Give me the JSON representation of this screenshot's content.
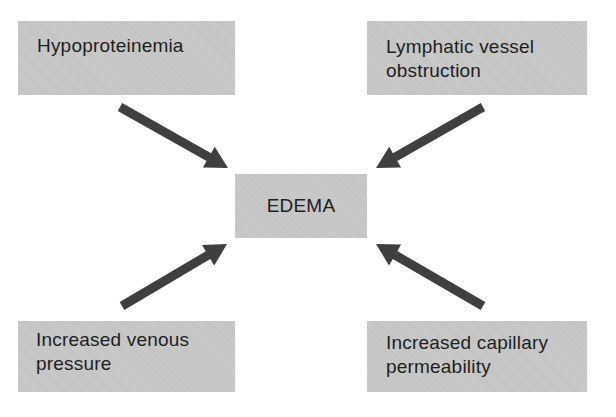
{
  "diagram": {
    "center": {
      "label": "EDEMA"
    },
    "causes": [
      {
        "id": "top-left",
        "label": "Hypoproteinemia"
      },
      {
        "id": "top-right",
        "label": "Lymphatic vessel obstruction"
      },
      {
        "id": "bottom-left",
        "label": "Increased venous pressure"
      },
      {
        "id": "bottom-right",
        "label": "Increased capillary permeability"
      }
    ],
    "edges": [
      {
        "from": "top-left",
        "to": "center"
      },
      {
        "from": "top-right",
        "to": "center"
      },
      {
        "from": "bottom-left",
        "to": "center"
      },
      {
        "from": "bottom-right",
        "to": "center"
      }
    ],
    "colors": {
      "box_fill": "#c8c8c8",
      "arrow": "#3f3f3f",
      "text": "#1e1e1e",
      "background": "#ffffff"
    }
  }
}
